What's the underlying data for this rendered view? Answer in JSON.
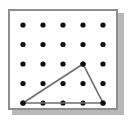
{
  "figure": {
    "background_color": "#ffffff",
    "frame": {
      "border_color": "#8e8e8e",
      "fill_color": "#ffffff",
      "shadow_color": "#b9b9b9",
      "x": 8,
      "y": 9,
      "width": 110,
      "height": 101
    }
  },
  "geoboard": {
    "rows": 5,
    "columns": 5,
    "peg_color": "#0b0b0b",
    "peg_radius": 2.6,
    "origin_x": 23,
    "origin_y": 25,
    "spacing_x": 20,
    "spacing_y": 19.5,
    "peg_count": 25,
    "pegs": [
      {
        "col": 1,
        "row": 1,
        "x": 23,
        "y": 25
      },
      {
        "col": 2,
        "row": 1,
        "x": 43,
        "y": 25
      },
      {
        "col": 3,
        "row": 1,
        "x": 63,
        "y": 25
      },
      {
        "col": 4,
        "row": 1,
        "x": 83,
        "y": 25
      },
      {
        "col": 5,
        "row": 1,
        "x": 103,
        "y": 25
      },
      {
        "col": 1,
        "row": 2,
        "x": 23,
        "y": 44.5
      },
      {
        "col": 2,
        "row": 2,
        "x": 43,
        "y": 44.5
      },
      {
        "col": 3,
        "row": 2,
        "x": 63,
        "y": 44.5
      },
      {
        "col": 4,
        "row": 2,
        "x": 83,
        "y": 44.5
      },
      {
        "col": 5,
        "row": 2,
        "x": 103,
        "y": 44.5
      },
      {
        "col": 1,
        "row": 3,
        "x": 23,
        "y": 64
      },
      {
        "col": 2,
        "row": 3,
        "x": 43,
        "y": 64
      },
      {
        "col": 3,
        "row": 3,
        "x": 63,
        "y": 64
      },
      {
        "col": 4,
        "row": 3,
        "x": 83,
        "y": 64
      },
      {
        "col": 5,
        "row": 3,
        "x": 103,
        "y": 64
      },
      {
        "col": 1,
        "row": 4,
        "x": 23,
        "y": 83.5
      },
      {
        "col": 2,
        "row": 4,
        "x": 43,
        "y": 83.5
      },
      {
        "col": 3,
        "row": 4,
        "x": 63,
        "y": 83.5
      },
      {
        "col": 4,
        "row": 4,
        "x": 83,
        "y": 83.5
      },
      {
        "col": 5,
        "row": 4,
        "x": 103,
        "y": 83.5
      },
      {
        "col": 1,
        "row": 5,
        "x": 23,
        "y": 103
      },
      {
        "col": 2,
        "row": 5,
        "x": 43,
        "y": 103
      },
      {
        "col": 3,
        "row": 5,
        "x": 63,
        "y": 103
      },
      {
        "col": 4,
        "row": 5,
        "x": 83,
        "y": 103
      },
      {
        "col": 5,
        "row": 5,
        "x": 103,
        "y": 103
      }
    ]
  },
  "shape": {
    "name": "triangle",
    "stroke_color": "#6e6e6e",
    "stroke_width": 1.6,
    "fill": "none",
    "closed": true,
    "vertex_count": 3,
    "vertices": [
      {
        "label": "left-base-vertex",
        "col": 1,
        "row": 5,
        "x": 23,
        "y": 103
      },
      {
        "label": "apex-vertex",
        "col": 4,
        "row": 3,
        "x": 83,
        "y": 64
      },
      {
        "label": "right-base-vertex",
        "col": 5,
        "row": 5,
        "x": 103,
        "y": 103
      }
    ],
    "path": "M 23 103 L 83 64 L 103 103 Z"
  },
  "chart_data": {
    "type": "scatter",
    "xlabel": "",
    "ylabel": "",
    "grid": false,
    "xlim": [
      1,
      5
    ],
    "ylim": [
      1,
      5
    ],
    "x": [
      1,
      2,
      3,
      4,
      5,
      1,
      2,
      3,
      4,
      5,
      1,
      2,
      3,
      4,
      5,
      1,
      2,
      3,
      4,
      5,
      1,
      2,
      3,
      4,
      5
    ],
    "y": [
      5,
      5,
      5,
      5,
      5,
      4,
      4,
      4,
      4,
      4,
      3,
      3,
      3,
      3,
      3,
      2,
      2,
      2,
      2,
      2,
      1,
      1,
      1,
      1,
      1
    ],
    "series": [
      {
        "name": "pegs",
        "marker": "circle",
        "color": "#0b0b0b",
        "values": [
          5,
          5,
          5,
          5,
          5,
          4,
          4,
          4,
          4,
          4,
          3,
          3,
          3,
          3,
          3,
          2,
          2,
          2,
          2,
          2,
          1,
          1,
          1,
          1,
          1
        ]
      },
      {
        "name": "triangle-outline",
        "marker": "line",
        "color": "#6e6e6e",
        "points": [
          [
            1,
            1
          ],
          [
            4,
            3
          ],
          [
            5,
            1
          ],
          [
            1,
            1
          ]
        ]
      }
    ],
    "annotations": []
  }
}
